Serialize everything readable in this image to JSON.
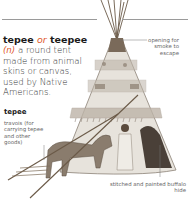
{
  "entry": {
    "headword": "tepee",
    "or_text": "or",
    "variant": "teepee",
    "part_of_speech": "(n)",
    "definition": "a round tent made from animal skins or canvas, used by Native Americans."
  },
  "illustration": {
    "subject_label": "tepee",
    "callouts": {
      "opening": "opening for smoke to escape",
      "travois": "travois (for carrying tepee and other goods)",
      "hide": "stitched and painted buffalo hide"
    }
  },
  "colors": {
    "accent": "#e0572a",
    "text": "#333333",
    "callout": "#666666",
    "rule": "#9a9a9a"
  }
}
